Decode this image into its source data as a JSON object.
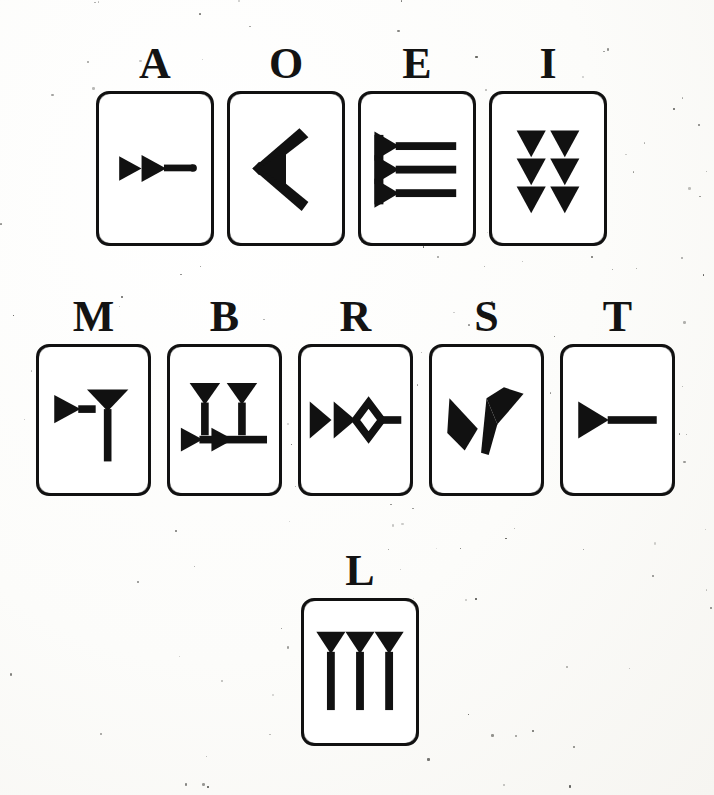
{
  "document": {
    "title": "Cuneiform Sign Card Chart",
    "description": "Chart of cuneiform sign cards each labelled with a Latin letter",
    "background_color": "#fdfdfb",
    "ink_color": "#111111",
    "card_fill": "#ffffff"
  },
  "rows": [
    {
      "id": "row-vowels",
      "x": 96,
      "y": 42,
      "card_width": 118,
      "card_height": 155,
      "card_gap": 13,
      "label_font_size": 44,
      "label_gap": 5,
      "cards": [
        {
          "letter": "A",
          "sign": "two-horizontal-wedges-with-tail"
        },
        {
          "letter": "O",
          "sign": "chevron-winkelhaken"
        },
        {
          "letter": "E",
          "sign": "three-stacked-horizontal-wedges"
        },
        {
          "letter": "I",
          "sign": "six-vertical-wedges-two-columns"
        }
      ]
    },
    {
      "id": "row-consonants",
      "x": 36,
      "y": 295,
      "card_width": 115,
      "card_height": 152,
      "card_gap": 16,
      "label_font_size": 44,
      "label_gap": 5,
      "cards": [
        {
          "letter": "M",
          "sign": "horizontal-wedge-with-vertical-descender"
        },
        {
          "letter": "B",
          "sign": "two-vertical-wedges-over-two-horizontal-wedges"
        },
        {
          "letter": "R",
          "sign": "double-wedge-with-elongated-diamond-tail"
        },
        {
          "letter": "S",
          "sign": "two-opposing-wedges-v-form"
        },
        {
          "letter": "T",
          "sign": "single-horizontal-wedge"
        }
      ]
    },
    {
      "id": "row-final",
      "x": 301,
      "y": 549,
      "card_width": 118,
      "card_height": 148,
      "card_gap": 0,
      "label_font_size": 44,
      "label_gap": 5,
      "cards": [
        {
          "letter": "L",
          "sign": "three-vertical-wedges-with-long-tails"
        }
      ]
    }
  ],
  "legend": {
    "letters": [
      "A",
      "O",
      "E",
      "I",
      "M",
      "B",
      "R",
      "S",
      "T",
      "L"
    ],
    "total_cards": 10
  }
}
